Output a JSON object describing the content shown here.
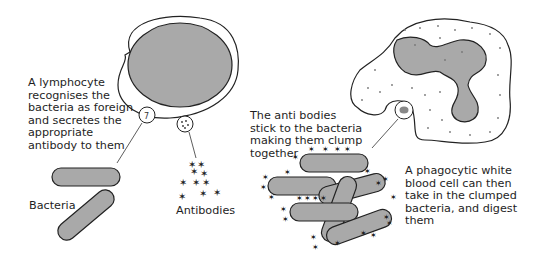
{
  "diagram": {
    "labels": {
      "lymphocyte": "A lymphocyte\nrecognises the\nbacteria as foreign\nand secretes the\nappropriate\nantibody to them",
      "bacteria": "Bacteria",
      "antibodies": "Antibodies",
      "stick": "The anti bodies\nstick to the bacteria\nmaking them clump\ntogether",
      "phagocyte": "A phagocytic white\nblood cell can then\ntake in the clumped\nbacteria, and digest\nthem"
    },
    "colors": {
      "outline": "#222222",
      "fill_grey": "#a9a9a9",
      "dots": "#777777",
      "background": "#ffffff"
    }
  }
}
